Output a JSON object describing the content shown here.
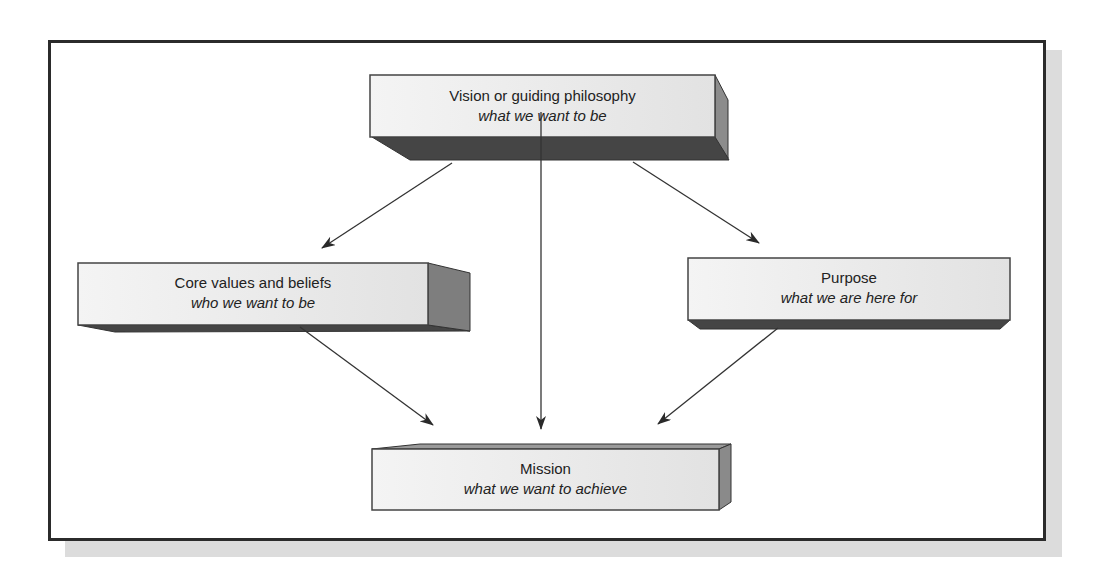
{
  "diagram": {
    "type": "flow-diagram",
    "nodes": [
      {
        "id": "vision",
        "title": "Vision or guiding philosophy",
        "subtitle": "what we want to be"
      },
      {
        "id": "core",
        "title": "Core values and beliefs",
        "subtitle": "who we want to be"
      },
      {
        "id": "purpose",
        "title": "Purpose",
        "subtitle": "what we are here for"
      },
      {
        "id": "mission",
        "title": "Mission",
        "subtitle": "what we want to achieve"
      }
    ],
    "edges": [
      {
        "from": "vision",
        "to": "core"
      },
      {
        "from": "vision",
        "to": "purpose"
      },
      {
        "from": "vision",
        "to": "mission"
      },
      {
        "from": "core",
        "to": "mission"
      },
      {
        "from": "purpose",
        "to": "mission"
      }
    ]
  },
  "colors": {
    "face": "#e9e9e9",
    "side": "#8a8a8a",
    "bottom": "#4a4a4a",
    "frame": "#2b2b2b",
    "shadow": "#dcdcdc",
    "arrow": "#333333"
  }
}
